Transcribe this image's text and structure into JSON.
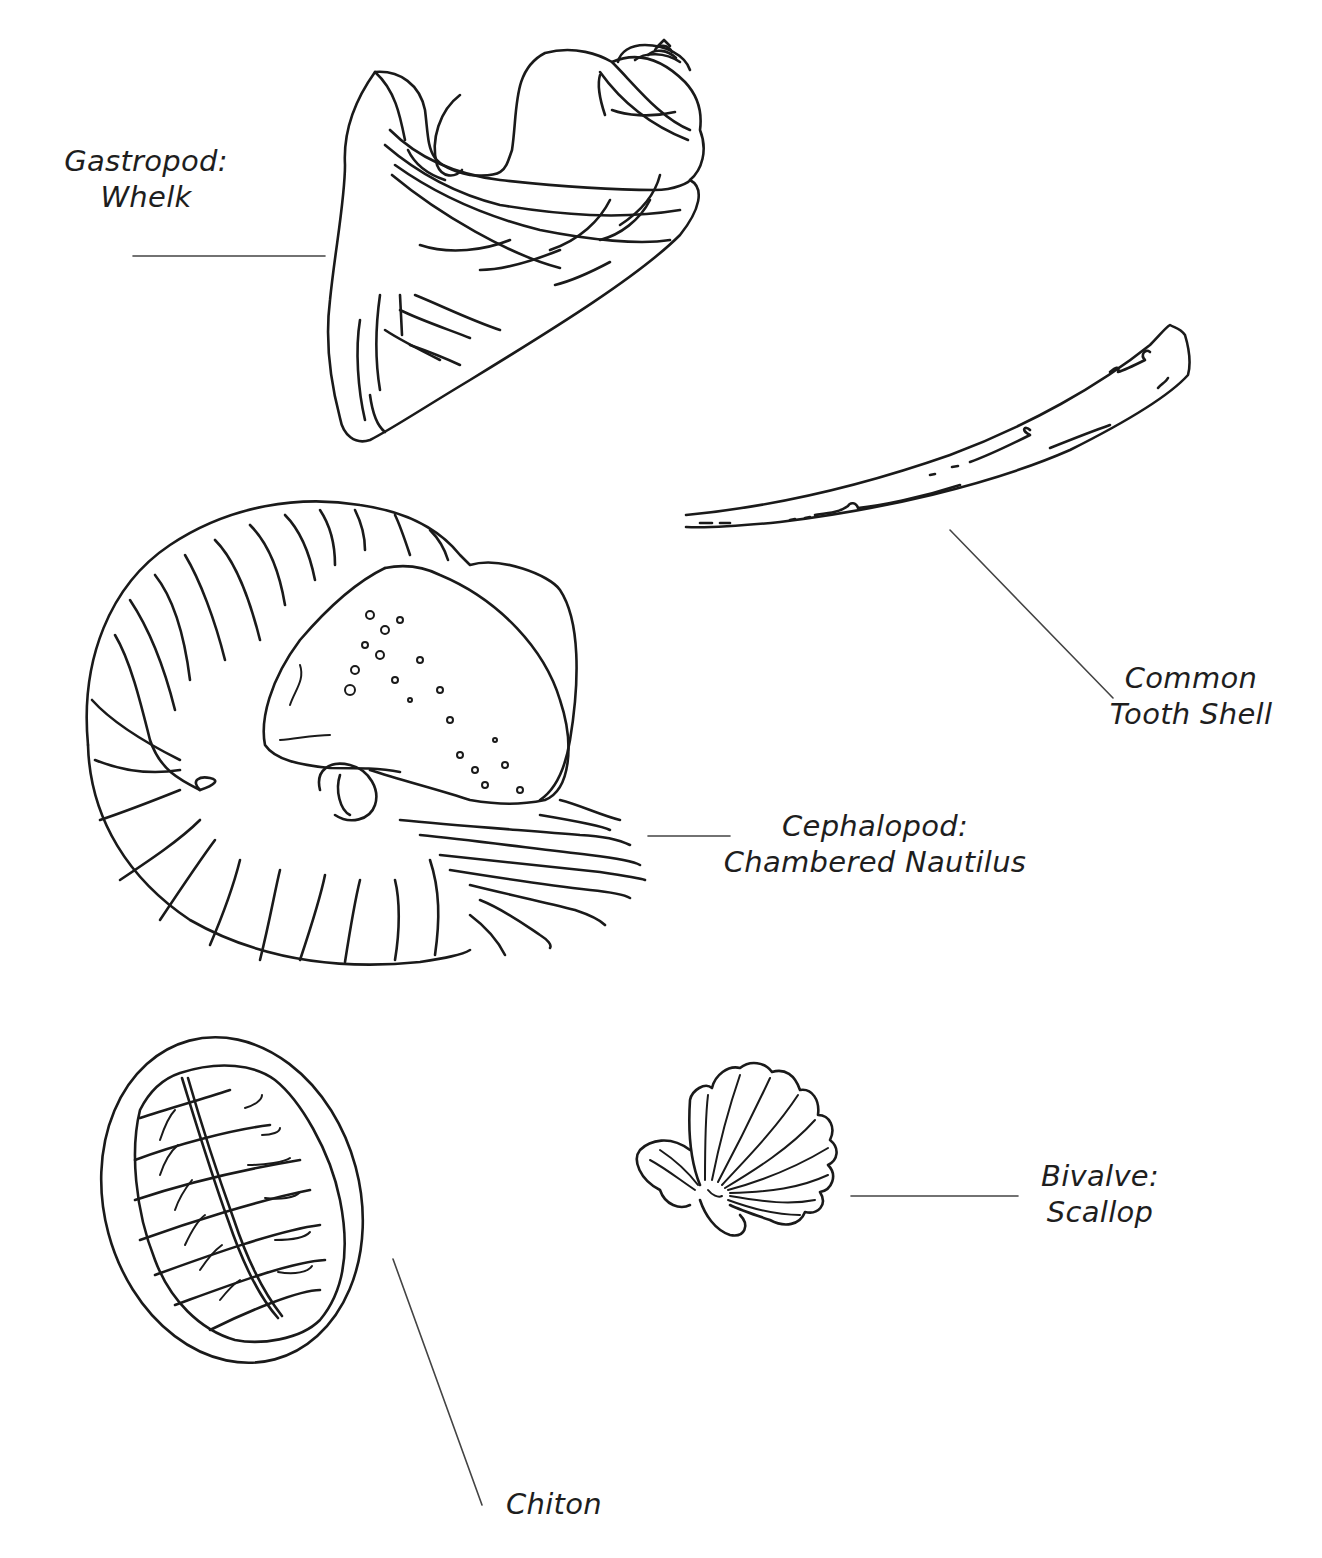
{
  "figure": {
    "background": "#ffffff",
    "line_color": "#1a1a1a",
    "specimens": [
      {
        "id": "whelk",
        "label_line1": "Gastropod:",
        "label_line2": "Whelk"
      },
      {
        "id": "tooth-shell",
        "label_line1": "Common",
        "label_line2": "Tooth Shell"
      },
      {
        "id": "nautilus",
        "label_line1": "Cephalopod:",
        "label_line2": "Chambered Nautilus"
      },
      {
        "id": "scallop",
        "label_line1": "Bivalve:",
        "label_line2": "Scallop"
      },
      {
        "id": "chiton",
        "label_line1": "Chiton",
        "label_line2": ""
      }
    ]
  }
}
